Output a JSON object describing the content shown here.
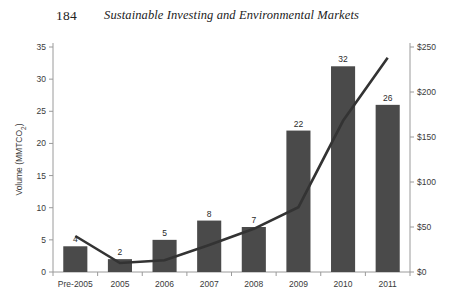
{
  "page": {
    "folio": "184",
    "running_title": "Sustainable Investing and Environmental Markets",
    "background_color": "#ffffff"
  },
  "chart_data": {
    "type": "bar",
    "title": "",
    "subtitle": "",
    "xlabel": "",
    "ylabel": "Volume (MMTCO₂)",
    "y2label": "",
    "categories": [
      "Pre-2005",
      "2005",
      "2006",
      "2007",
      "2008",
      "2009",
      "2010",
      "2011"
    ],
    "series": [
      {
        "name": "Volume",
        "type": "bar",
        "axis": "left",
        "values": [
          4,
          2,
          5,
          8,
          7,
          22,
          32,
          26
        ],
        "data_labels": [
          "4",
          "2",
          "5",
          "8",
          "7",
          "22",
          "32",
          "26"
        ],
        "color": "#4a4a4a"
      },
      {
        "name": "Value",
        "type": "line",
        "axis": "right",
        "values": [
          40,
          10,
          13,
          30,
          48,
          72,
          168,
          238
        ],
        "color": "#333333"
      }
    ],
    "ylim": [
      0,
      35
    ],
    "yticks": [
      0,
      5,
      10,
      15,
      20,
      25,
      30,
      35
    ],
    "ytick_labels": [
      "0",
      "5",
      "10",
      "15",
      "20",
      "25",
      "30",
      "35"
    ],
    "y2lim": [
      0,
      250
    ],
    "y2ticks": [
      0,
      50,
      100,
      150,
      200,
      250
    ],
    "y2tick_labels": [
      "$0",
      "$50",
      "$100",
      "$150",
      "$200",
      "$250"
    ],
    "grid": false,
    "legend": "none",
    "axis_color": "#9a9a9a"
  }
}
